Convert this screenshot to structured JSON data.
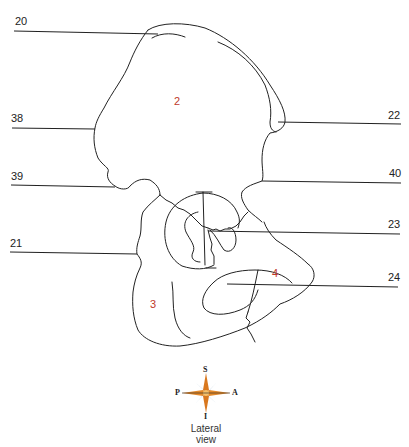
{
  "diagram": {
    "view_caption": [
      "Lateral",
      "view"
    ],
    "leader_labels": {
      "left": [
        {
          "id": "20",
          "text": "20",
          "y": 33
        },
        {
          "id": "38",
          "text": "38",
          "y": 128
        },
        {
          "id": "39",
          "text": "39",
          "y": 185
        },
        {
          "id": "21",
          "text": "21",
          "y": 253
        }
      ],
      "right": [
        {
          "id": "22",
          "text": "22",
          "y": 124
        },
        {
          "id": "40",
          "text": "40",
          "y": 182
        },
        {
          "id": "23",
          "text": "23",
          "y": 233
        },
        {
          "id": "24",
          "text": "24",
          "y": 286
        }
      ]
    },
    "region_labels": [
      {
        "id": "2",
        "text": "2",
        "color": "#c0392b"
      },
      {
        "id": "3",
        "text": "3",
        "color": "#c0392b"
      },
      {
        "id": "4",
        "text": "4",
        "color": "#c0392b"
      }
    ],
    "compass": {
      "top": "S",
      "bottom": "I",
      "left": "P",
      "right": "A",
      "colors": {
        "primary": "#e07a1f",
        "secondary": "#6b8fb3"
      }
    },
    "line_color": "#222222"
  }
}
